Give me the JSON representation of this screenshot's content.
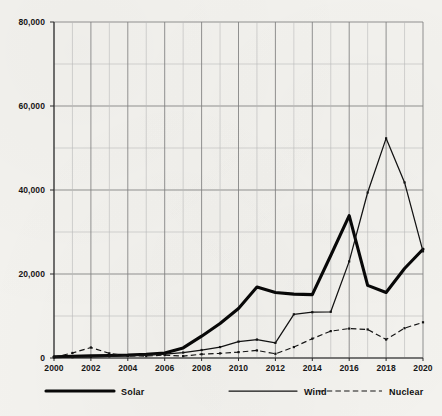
{
  "chart_data": {
    "type": "line",
    "title": "",
    "subtitle": "",
    "xlabel": "",
    "ylabel": "",
    "x": [
      2000,
      2001,
      2002,
      2003,
      2004,
      2005,
      2006,
      2007,
      2008,
      2009,
      2010,
      2011,
      2012,
      2013,
      2014,
      2015,
      2016,
      2017,
      2018,
      2019,
      2020
    ],
    "xlim": [
      2000,
      2020
    ],
    "ylim": [
      0,
      80000
    ],
    "y_major_ticks": [
      0,
      20000,
      40000,
      60000,
      80000
    ],
    "y_major_tick_labels": [
      "0",
      "20,000",
      "40,000",
      "60,000",
      "80,000"
    ],
    "y_minor_tick_interval": 10000,
    "x_tick_labels": [
      "2000",
      "2002",
      "2004",
      "2006",
      "2008",
      "2010",
      "2012",
      "2014",
      "2016",
      "2018",
      "2020"
    ],
    "x_tick_interval": 2,
    "grid": true,
    "legend_position": "bottom",
    "series": [
      {
        "name": "Solar",
        "style": "solid-thick",
        "color": "#080808",
        "values": [
          300,
          400,
          500,
          600,
          700,
          900,
          1200,
          2400,
          5200,
          8200,
          11800,
          16900,
          15600,
          15200,
          15100,
          24400,
          33900,
          17300,
          15600,
          21300,
          25900
        ]
      },
      {
        "name": "Wind",
        "style": "solid-thin",
        "color": "#121212",
        "values": [
          150,
          200,
          300,
          400,
          500,
          700,
          900,
          1300,
          1900,
          2600,
          3900,
          4400,
          3600,
          10400,
          10900,
          11000,
          23000,
          39400,
          52300,
          41800,
          25400
        ]
      },
      {
        "name": "Nuclear",
        "style": "dashed",
        "color": "#141214",
        "values": [
          200,
          1200,
          2500,
          1100,
          500,
          450,
          700,
          450,
          900,
          1100,
          1400,
          1800,
          1000,
          2600,
          4600,
          6400,
          7000,
          6800,
          4400,
          7100,
          8500
        ]
      }
    ],
    "series_endpoints_2020": {
      "Solar": 71900,
      "Wind": 49300,
      "Nuclear": 2800
    },
    "notable_points": {
      "solar_peak_2015": 33900,
      "solar_dip_2017": 15600,
      "solar_final_2020": 71900,
      "wind_peak_2018": 52300,
      "wind_final_2020": 49300,
      "nuclear_peak_2018": 8500,
      "nuclear_bump_2002": 2500
    }
  },
  "legend": {
    "items": [
      {
        "label": "Solar",
        "style": "solid-thick"
      },
      {
        "label": "Wind",
        "style": "solid-thin"
      },
      {
        "label": "Nuclear",
        "style": "dashed"
      }
    ]
  },
  "colors": {
    "background": "#f3f2ee",
    "grid_major": "#7e7e7e",
    "grid_minor": "#b9b9b9",
    "axis": "#2a2a2a",
    "text": "#161616"
  }
}
